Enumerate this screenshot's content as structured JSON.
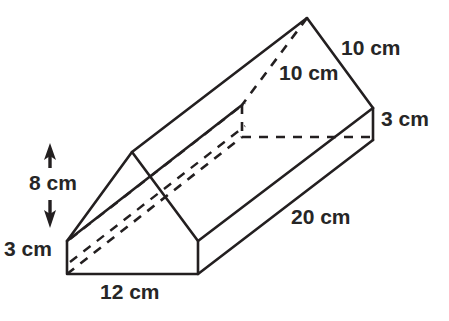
{
  "figure": {
    "type": "geometry-diagram",
    "shape": "pentagonal-prism",
    "stroke_color": "#231f20",
    "label_color": "#262626",
    "background_color": "#ffffff"
  },
  "labels": {
    "slant_right": "10 cm",
    "slant_left": "10 cm",
    "end_height": "3 cm",
    "length": "20 cm",
    "total_height": "8 cm",
    "base_height": "3 cm",
    "base_width": "12 cm"
  },
  "measurements": [
    {
      "name": "slant-right",
      "value": 10,
      "unit": "cm"
    },
    {
      "name": "slant-left",
      "value": 10,
      "unit": "cm"
    },
    {
      "name": "end-height",
      "value": 3,
      "unit": "cm"
    },
    {
      "name": "length",
      "value": 20,
      "unit": "cm"
    },
    {
      "name": "total-height",
      "value": 8,
      "unit": "cm"
    },
    {
      "name": "base-height",
      "value": 3,
      "unit": "cm"
    },
    {
      "name": "base-width",
      "value": 12,
      "unit": "cm"
    }
  ]
}
